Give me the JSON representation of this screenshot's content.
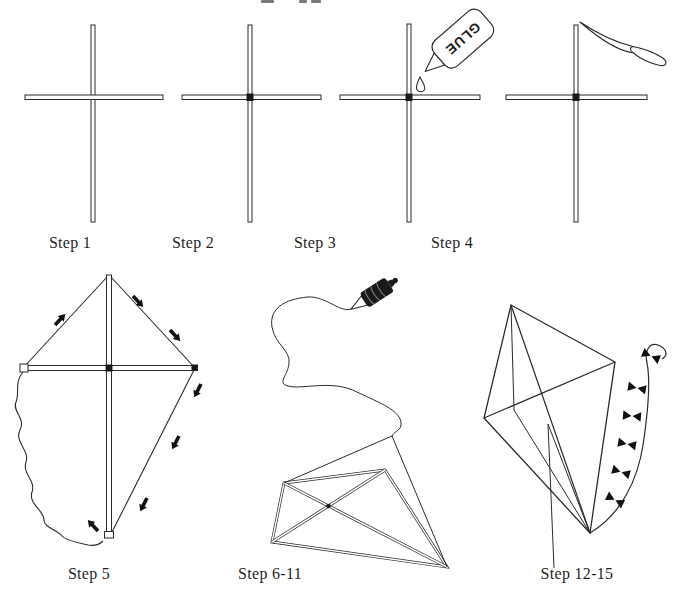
{
  "canvas": {
    "width": 683,
    "height": 600,
    "background": "#ffffff",
    "ink_color": "#2b2b2b",
    "fill_color": "#ffffff",
    "spool_color": "#1a1a1a",
    "bow_color": "#111111"
  },
  "diagram": {
    "glue_bottle_label": "GLUE",
    "top_edge": {
      "cropped_text_fragments_visible": true
    },
    "steps": [
      {
        "key": "step-1",
        "label": "Step 1",
        "icon": "crossed-sticks"
      },
      {
        "key": "step-2",
        "label": "Step 2",
        "icon": "crossed-sticks-tied-joint"
      },
      {
        "key": "step-3",
        "label": "Step 3",
        "icon": "glue-bottle-dripping-on-joint"
      },
      {
        "key": "step-4",
        "label": "Step 4",
        "icon": "knife-notching-stick-end"
      },
      {
        "key": "step-5",
        "label": "Step 5",
        "icon": "kite-frame-string-outline-arrows"
      },
      {
        "key": "step-6-11",
        "label": "Step 6-11",
        "icon": "covered-kite-bridle-and-string-spool"
      },
      {
        "key": "step-12-15",
        "label": "Step 12-15",
        "icon": "finished-kite-with-bow-tail"
      }
    ]
  }
}
